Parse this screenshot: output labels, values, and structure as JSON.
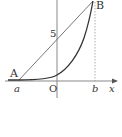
{
  "diagram": {
    "type": "function-graph",
    "colors": {
      "axis": "#888888",
      "curve": "#333333",
      "chord": "#666666",
      "dotted": "#999999",
      "text": "#333333"
    },
    "points": {
      "A": {
        "label": "A",
        "x_label": "a"
      },
      "B": {
        "label": "B",
        "x_label": "b"
      }
    },
    "labels": {
      "origin": "O",
      "x_axis": "x",
      "y_intercept": "5",
      "point_a": "A",
      "point_b": "B",
      "tick_a": "a",
      "tick_b": "b"
    }
  }
}
